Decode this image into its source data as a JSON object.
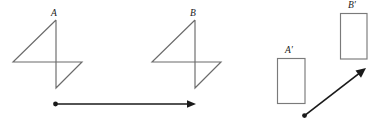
{
  "figure": {
    "background_color": "#ffffff",
    "shape_stroke_color": "#6b6b6b",
    "rect_stroke_color": "#7a7a7a",
    "vector_color": "#1a1a1a",
    "width": 383,
    "height": 122,
    "labels": {
      "a": "A",
      "b": "B",
      "a_prime": "A′",
      "b_prime": "B′"
    },
    "shapes": [
      {
        "name": "pinwheel-a",
        "label": "A",
        "label_x": 51,
        "label_y": 9,
        "type": "pinwheel",
        "apex": [
          56,
          20
        ],
        "left": [
          13,
          62
        ],
        "right": [
          82,
          62
        ],
        "bottom": [
          56,
          88
        ],
        "polyline": "56,20 13,62 82,62 56,88 56,20"
      },
      {
        "name": "pinwheel-b",
        "label": "B",
        "label_x": 190,
        "label_y": 9,
        "type": "pinwheel",
        "apex": [
          195,
          20
        ],
        "left": [
          152,
          62
        ],
        "right": [
          221,
          62
        ],
        "bottom": [
          195,
          88
        ],
        "polyline": "195,20 152,62 221,62 195,88 195,20"
      },
      {
        "name": "rectangle-a-prime",
        "label": "A′",
        "label_x": 285,
        "label_y": 46,
        "type": "rectangle",
        "x": 277,
        "y": 58,
        "width": 28,
        "height": 45
      },
      {
        "name": "rectangle-b-prime",
        "label": "B′",
        "label_x": 348,
        "label_y": 1,
        "type": "rectangle",
        "x": 340,
        "y": 13,
        "width": 27,
        "height": 46
      }
    ],
    "vectors": [
      {
        "name": "translation-vector-horizontal",
        "from": [
          55,
          104
        ],
        "to": [
          196,
          104
        ],
        "direction": "right",
        "dot_at_tail": true
      },
      {
        "name": "translation-vector-diagonal",
        "from": [
          304,
          116
        ],
        "to": [
          366,
          68
        ],
        "direction": "up-right",
        "dot_at_tail": true
      }
    ]
  }
}
